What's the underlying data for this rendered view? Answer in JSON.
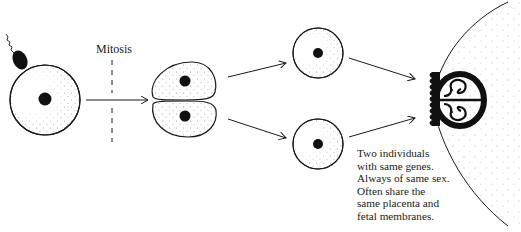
{
  "diagram": {
    "stages": [
      {
        "name": "fertilized-egg",
        "description": "Egg being fertilized by a sperm"
      },
      {
        "name": "two-cell-stage",
        "description": "Zygote divided into two cells"
      },
      {
        "name": "separated-cells",
        "description": "Two separated cells, each developing independently"
      },
      {
        "name": "twin-embryos",
        "description": "Two embryos sharing one placenta in the uterus"
      }
    ],
    "labels": {
      "mitosis": "Mitosis"
    },
    "caption": {
      "lines": [
        "Two individuals",
        "with same genes.",
        "Always of same sex.",
        "Often share the",
        "same placenta and",
        "fetal membranes."
      ]
    },
    "colors": {
      "ink": "#1a1a1a",
      "stipple": "#555555",
      "background": "#ffffff"
    }
  }
}
